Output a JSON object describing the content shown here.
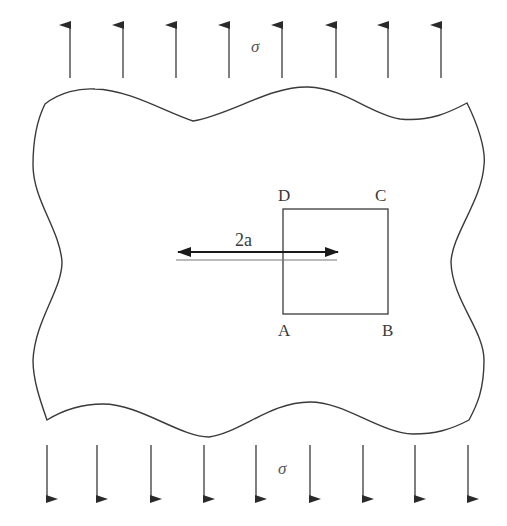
{
  "figure": {
    "stroke_color": "#3a3a3a",
    "background": "#ffffff"
  },
  "loads": {
    "top": {
      "label": "σ",
      "direction": "up",
      "arrow_x": [
        70,
        123,
        176,
        229,
        282,
        336,
        388,
        441
      ],
      "y_tip": 25,
      "y_base": 78
    },
    "bottom": {
      "label": "σ",
      "direction": "down",
      "arrow_x": [
        47,
        97,
        151,
        204,
        256,
        310,
        363,
        415,
        468
      ],
      "y_base": 445,
      "y_tip": 499
    }
  },
  "crack": {
    "dimension_label": "2a",
    "x_start": 177,
    "x_end": 338
  },
  "contour": {
    "corners": {
      "A": "A",
      "B": "B",
      "C": "C",
      "D": "D"
    }
  }
}
